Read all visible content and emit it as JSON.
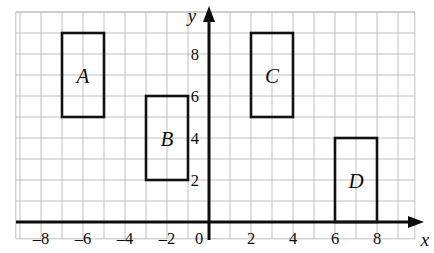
{
  "figure": {
    "axis_x_label": "x",
    "axis_y_label": "y",
    "origin_label": "0"
  },
  "chart_data": {
    "type": "scatter",
    "title": "",
    "xlabel": "x",
    "ylabel": "y",
    "xlim": [
      -9.2,
      9.8
    ],
    "ylim": [
      -0.8,
      10.0
    ],
    "grid": true,
    "grid_step": 1,
    "legend": "none",
    "xticks": [
      -8,
      -6,
      -4,
      -2,
      0,
      2,
      4,
      6,
      8
    ],
    "xtick_labels": [
      "–8",
      "–6",
      "–4",
      "–2",
      "0",
      "2",
      "4",
      "6",
      "8"
    ],
    "yticks": [
      2,
      4,
      6,
      8
    ],
    "ytick_labels": [
      "2",
      "4",
      "6",
      "8"
    ],
    "shapes": [
      {
        "name": "A",
        "type": "rectangle",
        "x0": -7,
        "x1": -5,
        "y0": 5,
        "y1": 9,
        "label_x": -6,
        "label_y": 7
      },
      {
        "name": "B",
        "type": "rectangle",
        "x0": -3,
        "x1": -1,
        "y0": 2,
        "y1": 6,
        "label_x": -2,
        "label_y": 4
      },
      {
        "name": "C",
        "type": "rectangle",
        "x0": 2,
        "x1": 4,
        "y0": 5,
        "y1": 9,
        "label_x": 3,
        "label_y": 7
      },
      {
        "name": "D",
        "type": "rectangle",
        "x0": 6,
        "x1": 8,
        "y0": 0,
        "y1": 4,
        "label_x": 7,
        "label_y": 2
      }
    ],
    "colors": {
      "grid": "#b9b9b9",
      "axis": "#0d0d0d",
      "shape_stroke": "#111111",
      "background": "#ffffff"
    }
  }
}
